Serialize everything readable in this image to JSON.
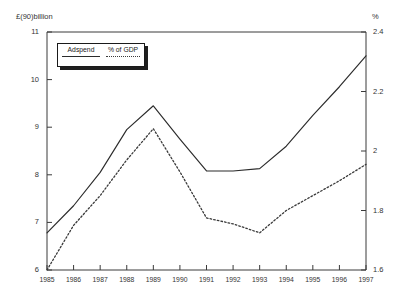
{
  "chart_data": {
    "type": "line",
    "title": "",
    "xlabel": "",
    "ylabel": "£(90)billion",
    "y2label": "%",
    "grid": false,
    "legend_position": "top-left",
    "categories": [
      "1985",
      "1986",
      "1987",
      "1988",
      "1989",
      "1990",
      "1991",
      "1992",
      "1993",
      "1994",
      "1995",
      "1996",
      "1997"
    ],
    "ylim": [
      6,
      11
    ],
    "yticks": [
      6,
      7,
      8,
      9,
      10,
      11
    ],
    "ytick_labels": [
      "6",
      "7",
      "8",
      "9",
      "10",
      "11"
    ],
    "y2lim": [
      1.6,
      2.4
    ],
    "y2ticks": [
      1.6,
      1.8,
      2.0,
      2.2,
      2.4
    ],
    "y2tick_labels": [
      "1.6",
      "1.8",
      "2",
      "2.2",
      "2.4"
    ],
    "series": [
      {
        "name": "Adspend",
        "axis": "left",
        "style": "solid",
        "values": [
          6.78,
          7.35,
          8.05,
          8.95,
          9.45,
          8.75,
          8.08,
          8.08,
          8.13,
          8.6,
          9.25,
          9.85,
          10.5
        ]
      },
      {
        "name": "% of GDP",
        "axis": "right",
        "style": "dotted",
        "values": [
          1.6,
          1.75,
          1.85,
          1.97,
          2.075,
          1.93,
          1.775,
          1.755,
          1.725,
          1.8,
          1.85,
          1.9,
          1.955
        ]
      }
    ]
  },
  "legend": {
    "items": [
      {
        "label": "Adspend",
        "style": "solid"
      },
      {
        "label": "% of GDP",
        "style": "dotted"
      }
    ]
  }
}
